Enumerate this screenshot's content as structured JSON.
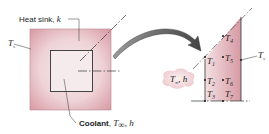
{
  "diagram": {
    "heat_sink": {
      "label": "Heat sink, ",
      "label_var": "k"
    },
    "surface_temp_left": {
      "var": "T",
      "sub": "s"
    },
    "surface_temp_right": {
      "var": "T",
      "sub": "s"
    },
    "coolant": {
      "label": "Coolant",
      "sep": ", ",
      "var": "T",
      "sub": "∞",
      "tail": ", h"
    },
    "bubble": {
      "var": "T",
      "sub": "∞",
      "tail": ", h"
    },
    "nodes": [
      {
        "name": "T",
        "sub": "1"
      },
      {
        "name": "T",
        "sub": "2"
      },
      {
        "name": "T",
        "sub": "3"
      },
      {
        "name": "T",
        "sub": "4"
      },
      {
        "name": "T",
        "sub": "5"
      },
      {
        "name": "T",
        "sub": "6"
      },
      {
        "name": "T",
        "sub": "7"
      }
    ],
    "colors": {
      "fill_dark": "#d9a0a8",
      "fill_light": "#f6e6e8",
      "line": "#333333",
      "arrow": "#555555"
    }
  }
}
